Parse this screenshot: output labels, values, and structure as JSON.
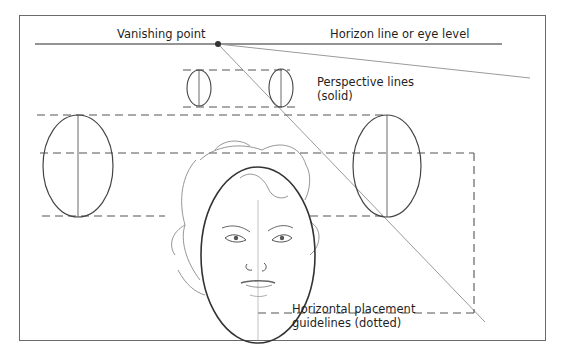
{
  "labels": {
    "vanishing_point": "Vanishing point",
    "horizon": "Horizon line or eye level",
    "perspective_line1": "Perspective lines",
    "perspective_line2": "(solid)",
    "guidelines_line1": "Horizontal placement",
    "guidelines_line2": "guidelines (dotted)"
  },
  "colors": {
    "ink": "#2a2a2a",
    "pencil": "#555555",
    "light_line": "#9a9a9a",
    "frame": "#6a6a6a"
  },
  "elements": {
    "vanishing_point": {
      "x": 218,
      "y": 44
    },
    "ellipses": [
      {
        "name": "small-left",
        "cx": 199,
        "cy": 88,
        "rx": 12,
        "ry": 18
      },
      {
        "name": "small-right",
        "cx": 281,
        "cy": 88,
        "rx": 12,
        "ry": 19
      },
      {
        "name": "large-left",
        "cx": 78,
        "cy": 166,
        "rx": 35,
        "ry": 51
      },
      {
        "name": "large-right",
        "cx": 387,
        "cy": 166,
        "rx": 34,
        "ry": 51
      },
      {
        "name": "face-oval",
        "cx": 258,
        "cy": 255,
        "rx": 57,
        "ry": 88
      }
    ]
  }
}
